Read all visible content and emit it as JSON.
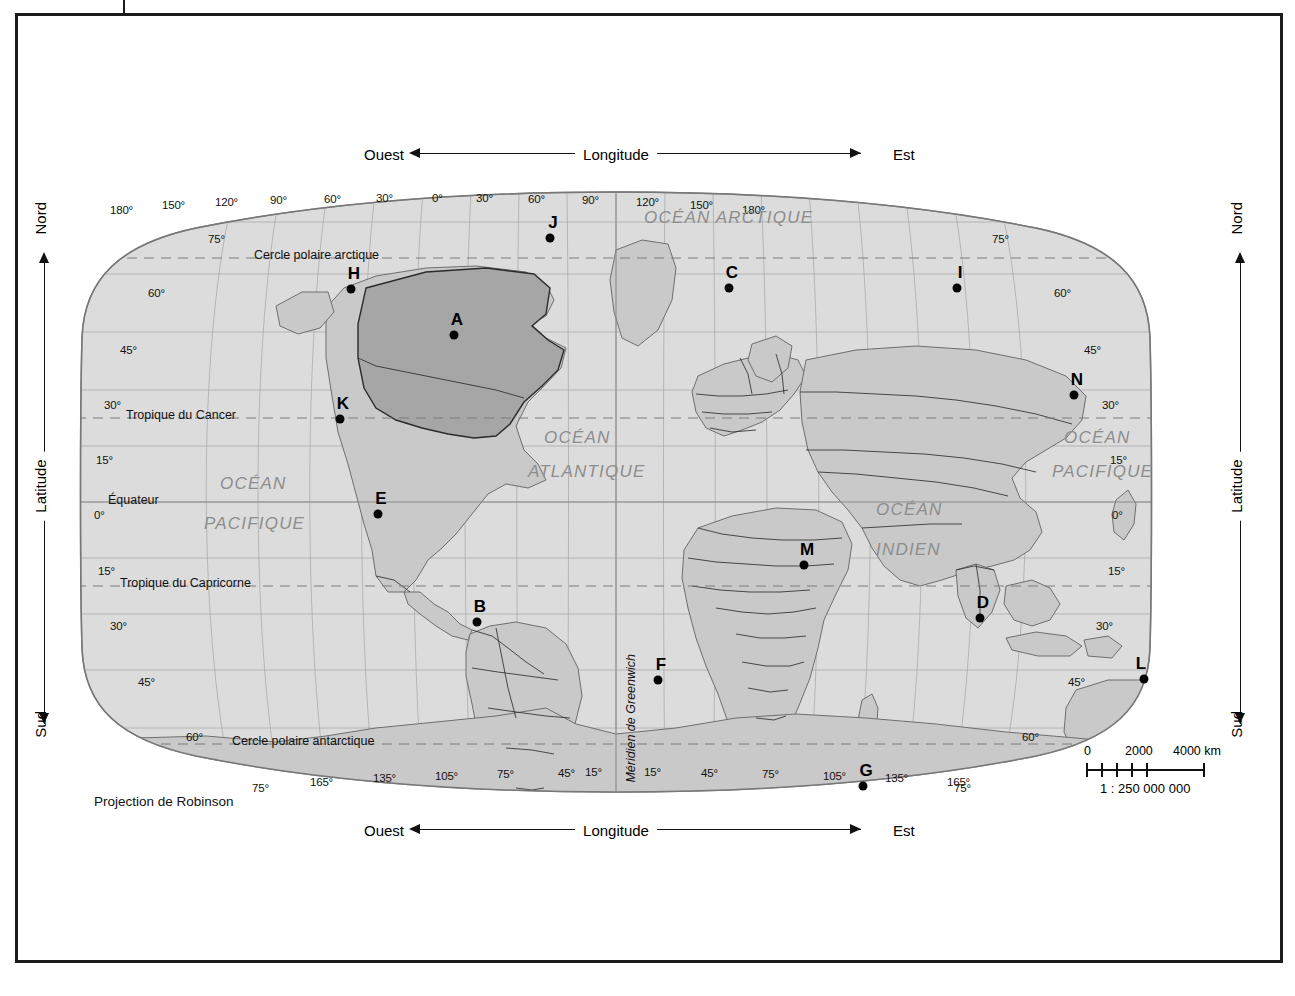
{
  "figure": {
    "projection_note": "Projection de Robinson",
    "prime_meridian_label": "Méridien de Greenwich"
  },
  "axes": {
    "longitude": {
      "title": "Longitude",
      "west": "Ouest",
      "east": "Est",
      "tick_labels_top": [
        "180°",
        "150°",
        "120°",
        "90°",
        "60°",
        "30°",
        "0°",
        "30°",
        "60°",
        "90°",
        "120°",
        "150°",
        "180°"
      ],
      "tick_labels_bottom": [
        "165°",
        "135°",
        "105°",
        "75°",
        "45°",
        "15°",
        "15°",
        "45°",
        "75°",
        "105°",
        "135°",
        "165°"
      ]
    },
    "latitude": {
      "title": "Latitude",
      "north": "Nord",
      "south": "Sud",
      "tick_labels_left": [
        "75°",
        "60°",
        "45°",
        "30°",
        "15°",
        "0°",
        "15°",
        "30°",
        "45°",
        "60°",
        "75°"
      ],
      "tick_labels_right": [
        "75°",
        "60°",
        "45°",
        "30°",
        "15°",
        "0°",
        "15°",
        "30°",
        "45°",
        "60°",
        "75°"
      ]
    }
  },
  "reference_lines": [
    {
      "name": "cercle-polaire-arctique",
      "label": "Cercle polaire arctique"
    },
    {
      "name": "tropique-du-cancer",
      "label": "Tropique du Cancer"
    },
    {
      "name": "equateur",
      "label": "Équateur"
    },
    {
      "name": "tropique-du-capricorne",
      "label": "Tropique du Capricorne"
    },
    {
      "name": "cercle-polaire-antarctique",
      "label": "Cercle polaire antarctique"
    }
  ],
  "ocean_labels": [
    {
      "name": "ocean-arctique",
      "lines": [
        "OCÉAN ARCTIQUE"
      ]
    },
    {
      "name": "ocean-atlantique",
      "lines": [
        "OCÉAN",
        "ATLANTIQUE"
      ]
    },
    {
      "name": "ocean-pacifique-ouest",
      "lines": [
        "OCÉAN",
        "PACIFIQUE"
      ]
    },
    {
      "name": "ocean-pacifique-est",
      "lines": [
        "OCÉAN",
        "PACIFIQUE"
      ]
    },
    {
      "name": "ocean-indien",
      "lines": [
        "OCÉAN",
        "INDIEN"
      ]
    }
  ],
  "scale": {
    "zero": "0",
    "mid": "2000",
    "max": "4000 km",
    "ratio": "1 : 250 000 000"
  },
  "markers": [
    {
      "id": "A",
      "x": 436,
      "y": 297
    },
    {
      "id": "B",
      "x": 459,
      "y": 584
    },
    {
      "id": "C",
      "x": 711,
      "y": 250
    },
    {
      "id": "D",
      "x": 962,
      "y": 580
    },
    {
      "id": "E",
      "x": 360,
      "y": 476
    },
    {
      "id": "F",
      "x": 640,
      "y": 642
    },
    {
      "id": "G",
      "x": 845,
      "y": 748
    },
    {
      "id": "H",
      "x": 333,
      "y": 251
    },
    {
      "id": "I",
      "x": 939,
      "y": 250
    },
    {
      "id": "J",
      "x": 532,
      "y": 200
    },
    {
      "id": "K",
      "x": 322,
      "y": 381
    },
    {
      "id": "L",
      "x": 1126,
      "y": 641
    },
    {
      "id": "M",
      "x": 786,
      "y": 527
    },
    {
      "id": "N",
      "x": 1056,
      "y": 357
    }
  ],
  "colors": {
    "ocean_fill": "#dcdcdc",
    "land_fill": "#c9c9c9",
    "highlight_fill": "#a6a6a6",
    "graticule": "#9a9a9a",
    "coastline": "#6e6e6e",
    "border": "#1c1c1c",
    "ocean_text": "#8d8d8d"
  }
}
